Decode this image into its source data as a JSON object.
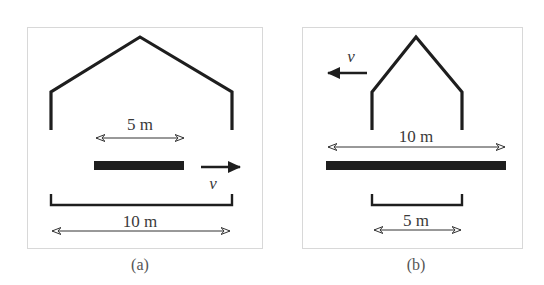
{
  "figure": {
    "colors": {
      "ink": "#1e1e1e",
      "frame": "#d8d8d8",
      "text": "#3a3a3a"
    },
    "panels": [
      {
        "id": "a",
        "caption": "(a)",
        "house_width_label": "10 m",
        "pole_length_label": "5 m",
        "velocity_label": "v",
        "velocity_direction": "right"
      },
      {
        "id": "b",
        "caption": "(b)",
        "house_width_label": "5 m",
        "pole_length_label": "10 m",
        "velocity_label": "v",
        "velocity_direction": "left"
      }
    ]
  }
}
